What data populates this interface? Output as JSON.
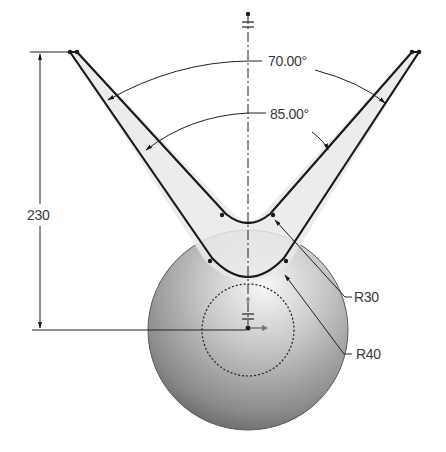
{
  "drawing": {
    "type": "cad-sketch",
    "dimensions": {
      "vertical_height": "230",
      "outer_angle": "70.00°",
      "inner_angle": "85.00°",
      "inner_radius": "R30",
      "outer_radius": "R40"
    },
    "colors": {
      "line": "#1a1a1a",
      "fill": "#ececec",
      "sphere_light": "#f4f4f4",
      "sphere_dark": "#5a5a5a",
      "text": "#3a3a3a"
    }
  }
}
